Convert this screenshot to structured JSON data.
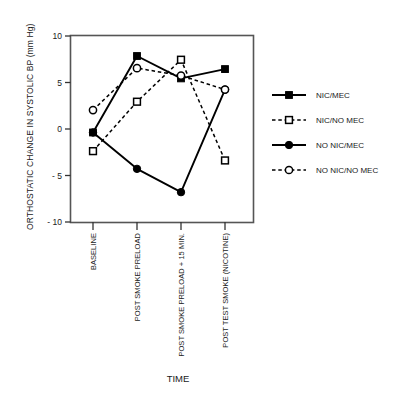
{
  "chart_data": {
    "type": "line",
    "title": "",
    "xlabel": "TIME",
    "ylabel": "ORTHOSTATIC CHANGE IN SYSTOLIC BP (mm Hg)",
    "categories": [
      "BASELINE",
      "POST SMOKE PRELOAD",
      "POST SMOKE PRELOAD + 15 MIN.",
      "POST TEST SMOKE (NICOTINE)"
    ],
    "ylim": [
      -10,
      10
    ],
    "yticks": [
      10,
      5,
      0,
      -5,
      -10
    ],
    "ytick_labels": [
      "10",
      "5",
      "0",
      "- 5",
      "- 10"
    ],
    "grid": false,
    "legend_position": "right",
    "series": [
      {
        "name": "NIC/MEC",
        "marker": "filled-square",
        "line": "solid",
        "color": "#000000",
        "values": [
          -0.4,
          7.8,
          5.4,
          6.4
        ]
      },
      {
        "name": "NIC/NO MEC",
        "marker": "open-square",
        "line": "dashed",
        "color": "#000000",
        "values": [
          -2.4,
          2.9,
          7.4,
          -3.4
        ]
      },
      {
        "name": "NO NIC/MEC",
        "marker": "filled-circle",
        "line": "solid",
        "color": "#000000",
        "values": [
          -0.4,
          -4.3,
          -6.8,
          4.2
        ]
      },
      {
        "name": "NO NIC/NO MEC",
        "marker": "open-circle",
        "line": "dashed",
        "color": "#000000",
        "values": [
          2.0,
          6.5,
          5.7,
          4.2
        ]
      }
    ]
  },
  "legend": {
    "items": [
      {
        "label": "NIC/MEC"
      },
      {
        "label": "NIC/NO MEC"
      },
      {
        "label": "NO NIC/MEC"
      },
      {
        "label": "NO NIC/NO MEC"
      }
    ]
  },
  "axes": {
    "y_title": "ORTHOSTATIC CHANGE IN SYSTOLIC BP (mm Hg)",
    "x_title": "TIME",
    "y_tick_labels": [
      "10",
      "5",
      "0",
      "- 5",
      "- 10"
    ],
    "x_tick_labels": [
      "BASELINE",
      "POST SMOKE PRELOAD",
      "POST SMOKE PRELOAD + 15 MIN.",
      "POST TEST SMOKE (NICOTINE)"
    ]
  }
}
